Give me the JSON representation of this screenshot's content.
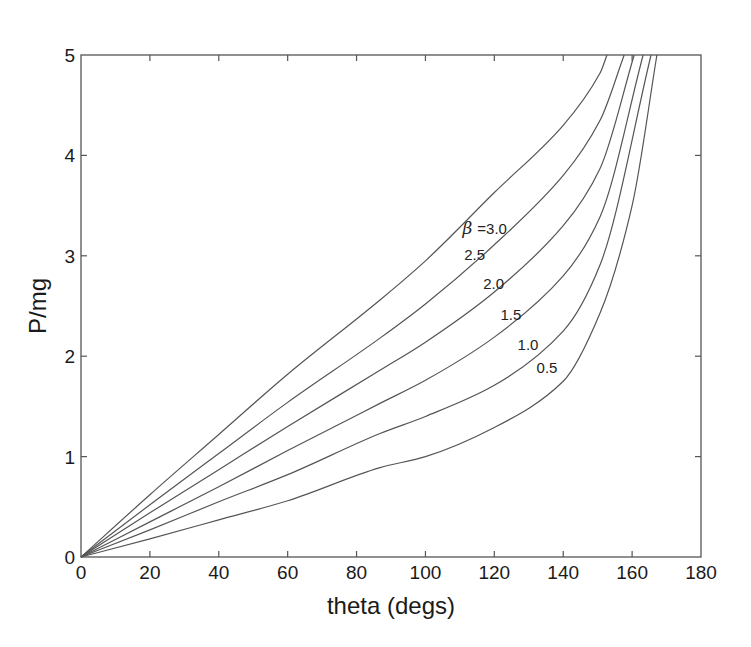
{
  "chart_data": {
    "type": "line",
    "title": "",
    "xlabel": "theta (degs)",
    "ylabel": "P/mg",
    "xlim": [
      0,
      180
    ],
    "ylim": [
      0,
      5
    ],
    "xticks": [
      0,
      20,
      40,
      60,
      80,
      100,
      120,
      140,
      160,
      180
    ],
    "yticks": [
      0,
      1,
      2,
      3,
      4,
      5
    ],
    "grid": false,
    "legend": "inline curve labels",
    "label_prefix": "β =",
    "series": [
      {
        "name": "3.0",
        "label_text": "=3.0",
        "label_pos": [
          120,
          3.22
        ],
        "x": [
          0,
          20,
          40,
          60,
          86.8,
          100,
          120,
          140,
          150.7,
          152.7
        ],
        "y": [
          0,
          0.62,
          1.22,
          1.82,
          2.56,
          2.95,
          3.63,
          4.3,
          4.82,
          5
        ]
      },
      {
        "name": "2.5",
        "label_text": "2.5",
        "label_pos": [
          113,
          2.96
        ],
        "x": [
          0,
          20,
          40,
          60,
          86.8,
          100,
          120,
          140,
          150.7,
          157.7
        ],
        "y": [
          0,
          0.52,
          1.03,
          1.54,
          2.18,
          2.52,
          3.11,
          3.8,
          4.35,
          5
        ]
      },
      {
        "name": "2.0",
        "label_text": "2.0",
        "label_pos": [
          118.5,
          2.67
        ],
        "x": [
          0,
          20,
          40,
          60,
          86.8,
          100,
          120,
          140,
          150.7,
          160.6
        ],
        "y": [
          0,
          0.44,
          0.87,
          1.3,
          1.86,
          2.14,
          2.64,
          3.3,
          3.87,
          5
        ]
      },
      {
        "name": "1.5",
        "label_text": "1.5",
        "label_pos": [
          123.5,
          2.36
        ],
        "x": [
          0,
          20,
          40,
          60,
          86.8,
          100,
          120,
          140,
          150.7,
          163.2
        ],
        "y": [
          0,
          0.35,
          0.7,
          1.06,
          1.53,
          1.76,
          2.19,
          2.8,
          3.39,
          5
        ]
      },
      {
        "name": "1.0",
        "label_text": "1.0",
        "label_pos": [
          128.5,
          2.06
        ],
        "x": [
          0,
          20,
          40,
          60,
          86.8,
          100,
          120,
          140,
          150.7,
          165.5
        ],
        "y": [
          0,
          0.27,
          0.55,
          0.82,
          1.23,
          1.4,
          1.71,
          2.25,
          2.91,
          5
        ]
      },
      {
        "name": "0.5",
        "label_text": "0.5",
        "label_pos": [
          134,
          1.83
        ],
        "x": [
          0,
          20,
          40,
          60,
          86.8,
          100,
          120,
          140,
          150.7,
          160,
          167.2
        ],
        "y": [
          0,
          0.18,
          0.37,
          0.56,
          0.89,
          1.0,
          1.29,
          1.75,
          2.43,
          3.5,
          5
        ]
      }
    ]
  },
  "colors": {
    "line": "#555555",
    "text": "#1a1a1a",
    "background": "#ffffff"
  }
}
